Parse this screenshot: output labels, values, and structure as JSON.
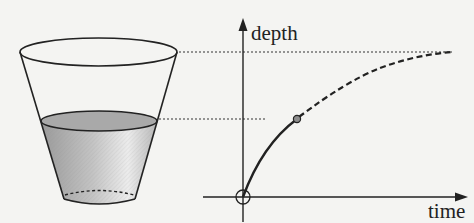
{
  "diagram": {
    "labels": {
      "y_axis": "depth",
      "x_axis": "time"
    },
    "colors": {
      "background": "#f4f4f2",
      "stroke": "#222222",
      "liquid_top": "#a8a8a8",
      "liquid_body_light": "#e6e6e6",
      "liquid_body_dark": "#a0a0a0",
      "point_fill": "#8c8c8c"
    },
    "cup": {
      "rim_y": 52,
      "liquid_level_y": 120,
      "base_y": 197
    },
    "graph": {
      "origin": [
        243,
        197
      ],
      "current_point": [
        297,
        119
      ],
      "full_depth_y": 52,
      "solid_segment": "origin to current point",
      "dashed_segment": "current point to full depth (asymptotic)"
    }
  }
}
